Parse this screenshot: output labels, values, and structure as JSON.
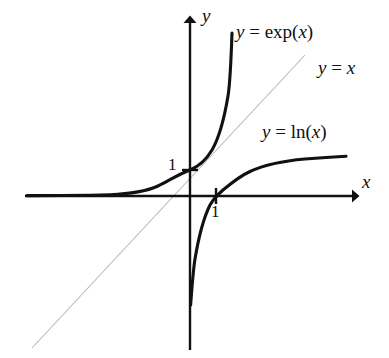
{
  "figure": {
    "background_color": "#ffffff",
    "width": 389,
    "height": 358
  },
  "labels": {
    "exp_curve": "y = exp(x)",
    "identity_line": "y = x",
    "ln_curve": "y = ln(x)",
    "x_axis": "x",
    "y_axis": "y",
    "tick_y_one": "1",
    "tick_x_one": "1"
  },
  "colors": {
    "curve": "#111111",
    "axis": "#111111",
    "identity_line": "#b8b8b8",
    "text": "#111111"
  },
  "chart_data": {
    "type": "line",
    "title": "",
    "xlabel": "x",
    "ylabel": "y",
    "grid": false,
    "legend": "inline-annotations",
    "axis_style": "arrows-through-origin",
    "origin_px": [
      190,
      196
    ],
    "unit_px": 26,
    "xlim": [
      -6.3,
      6.5
    ],
    "ylim": [
      -6.0,
      7.0
    ],
    "ticks": {
      "x": [
        1
      ],
      "y": [
        1
      ]
    },
    "series": [
      {
        "name": "y = exp(x)",
        "label": "y = exp(x)",
        "color": "#111111",
        "width": 3,
        "x": [
          -6.3,
          -5.6,
          -4.9,
          -4.2,
          -3.5,
          -2.8,
          -2.4,
          -2.0,
          -1.6,
          -1.2,
          -0.8,
          -0.4,
          0.0,
          0.3,
          0.6,
          0.9,
          1.2,
          1.5,
          1.7,
          1.85
        ],
        "y": [
          0.0018,
          0.0037,
          0.0074,
          0.015,
          0.03,
          0.061,
          0.091,
          0.135,
          0.202,
          0.301,
          0.449,
          0.67,
          1.0,
          1.35,
          1.82,
          2.46,
          3.32,
          4.48,
          5.47,
          6.36
        ]
      },
      {
        "name": "y = ln(x)",
        "label": "y = ln(x)",
        "color": "#111111",
        "width": 3,
        "x": [
          0.0018,
          0.0037,
          0.0074,
          0.015,
          0.03,
          0.061,
          0.091,
          0.135,
          0.202,
          0.301,
          0.449,
          0.67,
          1.0,
          1.35,
          1.82,
          2.46,
          3.32,
          4.48,
          5.47,
          6.36
        ],
        "y": [
          -6.3,
          -5.6,
          -4.9,
          -4.2,
          -3.5,
          -2.8,
          -2.4,
          -2.0,
          -1.6,
          -1.2,
          -0.8,
          -0.4,
          0.0,
          0.3,
          0.6,
          0.9,
          1.2,
          1.5,
          1.7,
          1.85
        ]
      },
      {
        "name": "y = x",
        "label": "y = x",
        "color": "#b8b8b8",
        "width": 1,
        "x": [
          -6.08,
          4.42
        ],
        "y": [
          -6.08,
          4.42
        ]
      }
    ]
  }
}
